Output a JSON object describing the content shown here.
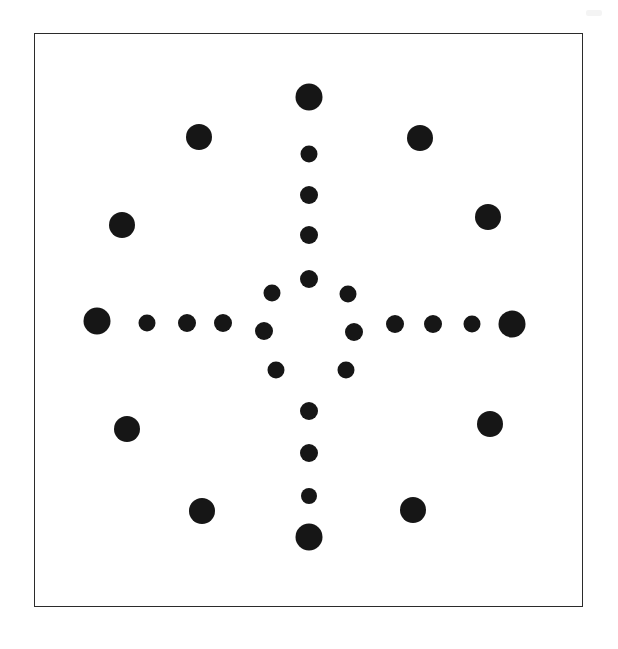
{
  "figure": {
    "background_color": "#ffffff",
    "dot_color": "#161616",
    "canvas": {
      "width": 618,
      "height": 649
    },
    "frame": {
      "x": 34,
      "y": 33,
      "width": 549,
      "height": 574,
      "border_width": 1.6,
      "border_color": "#2b2b2b"
    },
    "artifact": {
      "x": 586,
      "y": 10,
      "width": 16,
      "height": 6,
      "color": "#b9b9b9"
    },
    "center": {
      "x": 310,
      "y": 331
    }
  },
  "chart_data": {
    "type": "scatter",
    "xlabel": "",
    "ylabel": "",
    "xlim": [
      34,
      583
    ],
    "ylim": [
      33,
      607
    ],
    "grid": false,
    "legend": null,
    "groups": [
      {
        "name": "vertical-arm-up",
        "count": 5,
        "points": [
          {
            "x": 310,
            "y": 98,
            "r": 13.5
          },
          {
            "x": 310,
            "y": 155,
            "r": 8.5
          },
          {
            "x": 310,
            "y": 196,
            "r": 9.0
          },
          {
            "x": 310,
            "y": 236,
            "r": 9.0
          },
          {
            "x": 310,
            "y": 280,
            "r": 9.0
          }
        ]
      },
      {
        "name": "vertical-arm-down",
        "count": 5,
        "points": [
          {
            "x": 310,
            "y": 412,
            "r": 9.0
          },
          {
            "x": 310,
            "y": 454,
            "r": 9.0
          },
          {
            "x": 310,
            "y": 497,
            "r": 8.0
          },
          {
            "x": 310,
            "y": 538,
            "r": 13.5
          }
        ]
      },
      {
        "name": "horizontal-arm-left",
        "count": 5,
        "points": [
          {
            "x": 98,
            "y": 322,
            "r": 13.5
          },
          {
            "x": 148,
            "y": 324,
            "r": 8.5
          },
          {
            "x": 188,
            "y": 324,
            "r": 9.0
          },
          {
            "x": 224,
            "y": 324,
            "r": 9.0
          },
          {
            "x": 265,
            "y": 332,
            "r": 9.0
          }
        ]
      },
      {
        "name": "horizontal-arm-right",
        "count": 5,
        "points": [
          {
            "x": 355,
            "y": 333,
            "r": 9.0
          },
          {
            "x": 396,
            "y": 325,
            "r": 9.0
          },
          {
            "x": 434,
            "y": 325,
            "r": 9.0
          },
          {
            "x": 473,
            "y": 325,
            "r": 8.5
          },
          {
            "x": 513,
            "y": 325,
            "r": 13.5
          }
        ]
      },
      {
        "name": "inner-ring-diagonal",
        "count": 4,
        "points": [
          {
            "x": 273,
            "y": 294,
            "r": 8.5
          },
          {
            "x": 349,
            "y": 295,
            "r": 8.5
          },
          {
            "x": 277,
            "y": 371,
            "r": 8.5
          },
          {
            "x": 347,
            "y": 371,
            "r": 8.5
          }
        ]
      },
      {
        "name": "outer-diagonal-inner-pair",
        "count": 4,
        "points": [
          {
            "x": 200,
            "y": 138,
            "r": 13.0
          },
          {
            "x": 421,
            "y": 139,
            "r": 13.0
          },
          {
            "x": 203,
            "y": 512,
            "r": 13.0
          },
          {
            "x": 414,
            "y": 511,
            "r": 13.0
          }
        ]
      },
      {
        "name": "outer-diagonal-outer-pair",
        "count": 4,
        "points": [
          {
            "x": 123,
            "y": 226,
            "r": 13.0
          },
          {
            "x": 489,
            "y": 218,
            "r": 13.0
          },
          {
            "x": 128,
            "y": 430,
            "r": 13.0
          },
          {
            "x": 491,
            "y": 425,
            "r": 13.0
          }
        ]
      }
    ]
  }
}
